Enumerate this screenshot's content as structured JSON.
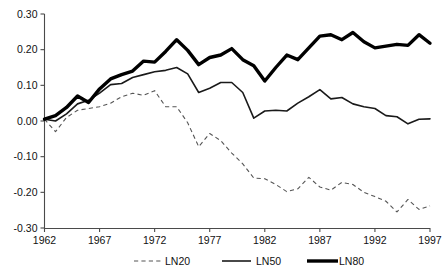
{
  "chart_data": {
    "type": "line",
    "title": "",
    "subtitle": "",
    "xlabel": "",
    "ylabel": "",
    "xlim": [
      1962,
      1997
    ],
    "ylim": [
      -0.3,
      0.3
    ],
    "grid": false,
    "legend_position": "bottom",
    "x": [
      1962,
      1963,
      1964,
      1965,
      1966,
      1967,
      1968,
      1969,
      1970,
      1971,
      1972,
      1973,
      1974,
      1975,
      1976,
      1977,
      1978,
      1979,
      1980,
      1981,
      1982,
      1983,
      1984,
      1985,
      1986,
      1987,
      1988,
      1989,
      1990,
      1991,
      1992,
      1993,
      1994,
      1995,
      1996,
      1997
    ],
    "xticks": [
      1962,
      1967,
      1972,
      1977,
      1982,
      1987,
      1992,
      1997
    ],
    "xtick_labels": [
      "1962",
      "1967",
      "1972",
      "1977",
      "1982",
      "1987",
      "1992",
      "1997"
    ],
    "yticks": [
      0.3,
      0.2,
      0.1,
      0.0,
      -0.1,
      -0.2,
      -0.3
    ],
    "ytick_labels": [
      "0.30",
      "0.20",
      "0.10",
      "0.00",
      "-0.10",
      "-0.20",
      "-0.30"
    ],
    "series": [
      {
        "name": "LN20",
        "style": "dashed-thin",
        "color": "#555555",
        "values": [
          0.005,
          -0.03,
          0.01,
          0.03,
          0.035,
          0.04,
          0.05,
          0.068,
          0.078,
          0.072,
          0.085,
          0.04,
          0.04,
          -0.005,
          -0.072,
          -0.035,
          -0.055,
          -0.09,
          -0.12,
          -0.16,
          -0.162,
          -0.178,
          -0.198,
          -0.19,
          -0.158,
          -0.185,
          -0.194,
          -0.172,
          -0.178,
          -0.2,
          -0.212,
          -0.225,
          -0.255,
          -0.22,
          -0.248,
          -0.238
        ]
      },
      {
        "name": "LN50",
        "style": "solid-medium",
        "color": "#1a1a1a",
        "values": [
          0.005,
          0.0,
          0.02,
          0.048,
          0.058,
          0.078,
          0.102,
          0.105,
          0.122,
          0.13,
          0.138,
          0.142,
          0.15,
          0.132,
          0.08,
          0.092,
          0.108,
          0.108,
          0.08,
          0.008,
          0.028,
          0.03,
          0.028,
          0.05,
          0.068,
          0.088,
          0.062,
          0.066,
          0.048,
          0.04,
          0.035,
          0.015,
          0.012,
          -0.008,
          0.005,
          0.006
        ]
      },
      {
        "name": "LN80",
        "style": "solid-thick",
        "color": "#000000",
        "values": [
          0.005,
          0.015,
          0.038,
          0.07,
          0.052,
          0.09,
          0.118,
          0.13,
          0.14,
          0.168,
          0.165,
          0.195,
          0.228,
          0.198,
          0.158,
          0.178,
          0.185,
          0.203,
          0.172,
          0.155,
          0.112,
          0.15,
          0.185,
          0.172,
          0.205,
          0.238,
          0.242,
          0.228,
          0.248,
          0.222,
          0.205,
          0.21,
          0.215,
          0.212,
          0.242,
          0.218
        ]
      }
    ]
  },
  "legend": {
    "items": [
      {
        "label": "LN20",
        "key": "ln20"
      },
      {
        "label": "LN50",
        "key": "ln50"
      },
      {
        "label": "LN80",
        "key": "ln80"
      }
    ]
  },
  "colors": {
    "ln20": "#555555",
    "ln50": "#1a1a1a",
    "ln80": "#000000",
    "axis": "#4a4a4a",
    "background": "#ffffff"
  }
}
